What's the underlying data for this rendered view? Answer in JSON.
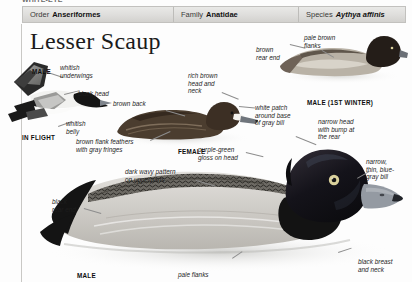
{
  "running_head": "WHITE-EYE",
  "taxonomy": {
    "order": {
      "label": "Order",
      "value": "Anseriformes"
    },
    "family": {
      "label": "Family",
      "value": "Anatidae"
    },
    "species": {
      "label": "Species",
      "value": "Aythya affinis"
    }
  },
  "title": "Lesser Scaup",
  "captions": {
    "male_flight": "MALE",
    "in_flight": "IN FLIGHT",
    "female": "FEMALE",
    "male_first_winter": "MALE (1ST WINTER)",
    "male": "MALE"
  },
  "annotations": {
    "whitish_underwings": "whitish\nunderwings",
    "black_head": "black head",
    "whitish_belly": "whitish\nbelly",
    "brown_back": "brown back",
    "rich_brown_head": "rich brown\nhead and\nneck",
    "brown_flank_feathers": "brown flank feathers\nwith gray fringes",
    "white_patch": "white patch\naround base\nof gray bill",
    "brown_rear_end": "brown\nrear end",
    "pale_brown_flanks": "pale brown\nflanks",
    "narrow_head_bump": "narrow head\nwith bump at\nthe rear",
    "narrow_bill": "narrow,\nthin, blue-\ngray bill",
    "purple_green_gloss": "purple-green\ngloss on head",
    "dark_wavy_pattern": "dark wavy pattern\non upperparts",
    "black_rear_end": "black\nrear end",
    "pale_flanks": "pale flanks",
    "black_breast_neck": "black breast\nand neck"
  },
  "colors": {
    "bar_background": "#dedddb",
    "bar_border": "#c2c1be",
    "page_background": "#fdfdfd",
    "title_text": "#1b1b1b",
    "annotation_text": "#1d1d1d",
    "leader_line": "#8d8d8d",
    "duck_black": "#1a1a1a",
    "duck_brown": "#5a4636",
    "duck_gray": "#9a9a98",
    "bill_blue_gray": "#8e949c",
    "eye_yellow": "#d8cf9a"
  }
}
